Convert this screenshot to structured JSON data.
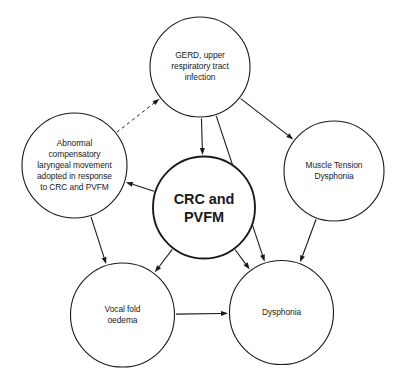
{
  "diagram": {
    "type": "node-link-diagram",
    "background_color": "#ffffff",
    "stroke_color": "#1a1a1a",
    "nodes": [
      {
        "id": "gerd",
        "label": "GERD, upper\nrespiratory tract\ninfection",
        "cx": 200,
        "cy": 67,
        "r": 50,
        "emphasis": false
      },
      {
        "id": "abnormal",
        "label": "Abnormal\ncompensatory\nlaryngeal movement\nadopted in response\nto CRC and PVFM",
        "cx": 74.5,
        "cy": 165.5,
        "r": 52.5,
        "emphasis": false
      },
      {
        "id": "crc-pvfm",
        "label": "CRC and\nPVFM",
        "cx": 204,
        "cy": 207.5,
        "r": 51,
        "emphasis": true
      },
      {
        "id": "muscle-tension",
        "label": "Muscle Tension\nDysphonia",
        "cx": 334,
        "cy": 171,
        "r": 50,
        "emphasis": false
      },
      {
        "id": "vocal-fold",
        "label": "Vocal fold\noedema",
        "cx": 122.5,
        "cy": 315,
        "r": 52,
        "emphasis": false
      },
      {
        "id": "dysphonia",
        "label": "Dysphonia",
        "cx": 281.5,
        "cy": 312.5,
        "r": 52,
        "emphasis": false
      }
    ],
    "edges": [
      {
        "id": "abnormal-to-gerd",
        "from": "abnormal",
        "to": "gerd",
        "style": "dashed",
        "arrow": true
      },
      {
        "id": "gerd-to-crc",
        "from": "gerd",
        "to": "crc-pvfm",
        "style": "solid",
        "arrow": true
      },
      {
        "id": "gerd-to-muscle-tension",
        "from": "gerd",
        "to": "muscle-tension",
        "style": "solid",
        "arrow": true
      },
      {
        "id": "gerd-to-dysphonia",
        "from": "gerd",
        "to": "dysphonia",
        "style": "solid",
        "arrow": true
      },
      {
        "id": "crc-to-abnormal",
        "from": "crc-pvfm",
        "to": "abnormal",
        "style": "solid",
        "arrow": true
      },
      {
        "id": "crc-to-vocal-fold",
        "from": "crc-pvfm",
        "to": "vocal-fold",
        "style": "solid",
        "arrow": true
      },
      {
        "id": "crc-to-dysphonia",
        "from": "crc-pvfm",
        "to": "dysphonia",
        "style": "solid",
        "arrow": true
      },
      {
        "id": "abnormal-to-vocal-fold",
        "from": "abnormal",
        "to": "vocal-fold",
        "style": "solid",
        "arrow": true
      },
      {
        "id": "muscle-tension-to-dysphonia",
        "from": "muscle-tension",
        "to": "dysphonia",
        "style": "solid",
        "arrow": true
      },
      {
        "id": "vocal-fold-to-dysphonia",
        "from": "vocal-fold",
        "to": "dysphonia",
        "style": "solid",
        "arrow": true
      }
    ]
  }
}
